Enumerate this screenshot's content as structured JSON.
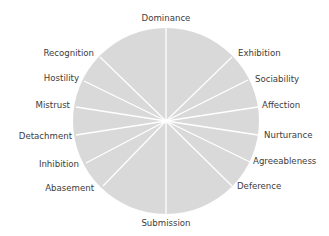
{
  "diagram": {
    "type": "interpersonal-circumplex",
    "center": {
      "x": 166,
      "y": 121
    },
    "radius": 93,
    "colors": {
      "disc_fill": "#d9d9d9",
      "spoke": "#ffffff",
      "label": "#3c3c3c",
      "background": "#ffffff"
    },
    "top_label": {
      "text": "Dominance",
      "x": 166,
      "y": 21,
      "anchor": "middle"
    },
    "bottom_label": {
      "text": "Submission",
      "x": 166,
      "y": 226,
      "anchor": "middle"
    },
    "spokes": [
      {
        "name": "Dominance",
        "x2": 166,
        "y2": 28
      },
      {
        "name": "Exhibition",
        "x2": 232,
        "y2": 57
      },
      {
        "name": "Sociability",
        "x2": 248,
        "y2": 80
      },
      {
        "name": "Affection",
        "x2": 258,
        "y2": 107
      },
      {
        "name": "Nurturance",
        "x2": 258,
        "y2": 135
      },
      {
        "name": "Agreeableness",
        "x2": 250,
        "y2": 162
      },
      {
        "name": "Deference",
        "x2": 232,
        "y2": 186
      },
      {
        "name": "Submission",
        "x2": 166,
        "y2": 214
      },
      {
        "name": "Abasement",
        "x2": 103,
        "y2": 186
      },
      {
        "name": "Inhibition",
        "x2": 86,
        "y2": 163
      },
      {
        "name": "Detachment",
        "x2": 76,
        "y2": 135
      },
      {
        "name": "Mistrust",
        "x2": 76,
        "y2": 107
      },
      {
        "name": "Hostility",
        "x2": 84,
        "y2": 81
      },
      {
        "name": "Recognition",
        "x2": 100,
        "y2": 57
      }
    ],
    "right_labels": [
      {
        "text": "Exhibition",
        "x": 238,
        "y": 56
      },
      {
        "text": "Sociability",
        "x": 255,
        "y": 82
      },
      {
        "text": "Affection",
        "x": 262,
        "y": 108
      },
      {
        "text": "Nurturance",
        "x": 264,
        "y": 138
      },
      {
        "text": "Agreeableness",
        "x": 253,
        "y": 164
      },
      {
        "text": "Deference",
        "x": 237,
        "y": 189
      }
    ],
    "left_labels": [
      {
        "text": "Recognition",
        "x": 94,
        "y": 56
      },
      {
        "text": "Hostility",
        "x": 79,
        "y": 81
      },
      {
        "text": "Mistrust",
        "x": 70,
        "y": 108
      },
      {
        "text": "Detachment",
        "x": 72,
        "y": 139
      },
      {
        "text": "Inhibition",
        "x": 79,
        "y": 167
      },
      {
        "text": "Abasement",
        "x": 94,
        "y": 191
      }
    ]
  }
}
